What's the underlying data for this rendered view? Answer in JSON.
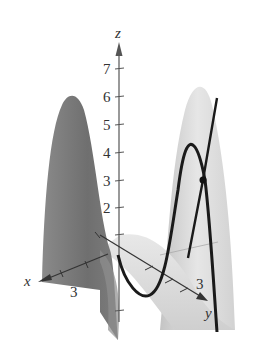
{
  "figure": {
    "axes": {
      "x": {
        "label": "x",
        "tick_label": "3"
      },
      "y": {
        "label": "y",
        "tick_label": "3"
      },
      "z": {
        "label": "z",
        "tick_labels": [
          "1",
          "2",
          "3",
          "4",
          "5",
          "6",
          "7"
        ],
        "visible_tick_labels": [
          "2",
          "3",
          "4",
          "5",
          "6",
          "7"
        ]
      }
    },
    "colors": {
      "left_peak": "#7a7a7a",
      "right_peak": "#d8d8d8",
      "curve": "#1a1a1a",
      "axis": "#555555"
    },
    "marked_point": {
      "z_approx": 3
    }
  }
}
